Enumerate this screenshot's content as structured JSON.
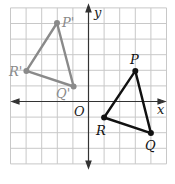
{
  "axes": {
    "x_label": "x",
    "y_label": "y",
    "origin_label": "O"
  },
  "grid": {
    "x_min": -5,
    "x_max": 5,
    "y_min": -4,
    "y_max": 6,
    "color": "#c8c8c8"
  },
  "triangles": [
    {
      "name": "image",
      "color": "#8a8a8a",
      "vertices": [
        {
          "label": "P'",
          "x": -2,
          "y": 5
        },
        {
          "label": "Q'",
          "x": -1,
          "y": 1
        },
        {
          "label": "R'",
          "x": -4,
          "y": 2
        }
      ]
    },
    {
      "name": "preimage",
      "color": "#111111",
      "vertices": [
        {
          "label": "P",
          "x": 3,
          "y": 2
        },
        {
          "label": "Q",
          "x": 4,
          "y": -2
        },
        {
          "label": "R",
          "x": 1,
          "y": -1
        }
      ]
    }
  ]
}
